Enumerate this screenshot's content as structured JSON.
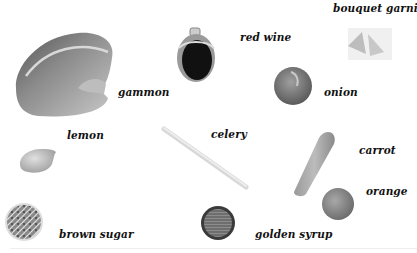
{
  "ingredients": [
    {
      "id": "gammon",
      "label": "gammon"
    },
    {
      "id": "red-wine",
      "label": "red wine"
    },
    {
      "id": "bouquet-garni",
      "label": "bouquet garni"
    },
    {
      "id": "onion",
      "label": "onion"
    },
    {
      "id": "lemon",
      "label": "lemon"
    },
    {
      "id": "celery",
      "label": "celery"
    },
    {
      "id": "carrot",
      "label": "carrot"
    },
    {
      "id": "orange",
      "label": "orange"
    },
    {
      "id": "brown-sugar",
      "label": "brown sugar"
    },
    {
      "id": "golden-syrup",
      "label": "golden syrup"
    }
  ],
  "colors": {
    "background": "#ffffff",
    "text": "#111111"
  }
}
